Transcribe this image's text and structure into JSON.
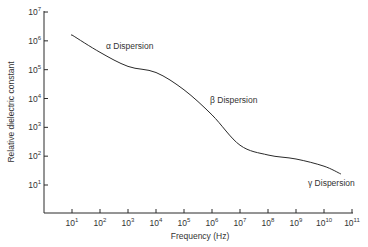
{
  "chart_data": {
    "type": "line",
    "title": "",
    "xlabel": "Frequency (Hz)",
    "ylabel": "Relative dielectric constant",
    "xscale": "log",
    "yscale": "log",
    "xlim_exp": [
      0,
      11
    ],
    "ylim_exp": [
      0,
      7
    ],
    "x_ticks": [
      "10^1",
      "10^2",
      "10^3",
      "10^4",
      "10^5",
      "10^6",
      "10^7",
      "10^8",
      "10^9",
      "10^10",
      "10^11"
    ],
    "x_tick_exp": [
      1,
      2,
      3,
      4,
      5,
      6,
      7,
      8,
      9,
      10,
      11
    ],
    "y_ticks": [
      "10^1",
      "10^2",
      "10^3",
      "10^4",
      "10^5",
      "10^6",
      "10^7"
    ],
    "y_tick_exp": [
      1,
      2,
      3,
      4,
      5,
      6,
      7
    ],
    "grid": false,
    "legend": null,
    "series": [
      {
        "name": "Relative dielectric constant",
        "x": [
          10,
          100,
          1000,
          10000,
          100000,
          1000000,
          10000000,
          100000000,
          1000000000,
          10000000000,
          40000000000
        ],
        "values": [
          1600000,
          400000,
          130000,
          80000,
          20000,
          2700,
          240,
          110,
          80,
          45,
          24
        ]
      }
    ],
    "annotations": [
      {
        "text": "α Dispersion",
        "x_exp": 2.2,
        "y_exp": 5.7
      },
      {
        "text": "β Dispersion",
        "x_exp": 5.9,
        "y_exp": 3.9
      },
      {
        "text": "γ Dispersion",
        "x_exp": 9.5,
        "y_exp": 1.1
      }
    ]
  },
  "axes": {
    "x_title": "Frequency (Hz)",
    "y_title": "Relative dielectric constant",
    "x_tick_labels": [
      {
        "base": "10",
        "exp": "1"
      },
      {
        "base": "10",
        "exp": "2"
      },
      {
        "base": "10",
        "exp": "3"
      },
      {
        "base": "10",
        "exp": "4"
      },
      {
        "base": "10",
        "exp": "5"
      },
      {
        "base": "10",
        "exp": "6"
      },
      {
        "base": "10",
        "exp": "7"
      },
      {
        "base": "10",
        "exp": "8"
      },
      {
        "base": "10",
        "exp": "9"
      },
      {
        "base": "10",
        "exp": "10"
      },
      {
        "base": "10",
        "exp": "11"
      }
    ],
    "y_tick_labels": [
      {
        "base": "10",
        "exp": "1"
      },
      {
        "base": "10",
        "exp": "2"
      },
      {
        "base": "10",
        "exp": "3"
      },
      {
        "base": "10",
        "exp": "4"
      },
      {
        "base": "10",
        "exp": "5"
      },
      {
        "base": "10",
        "exp": "6"
      },
      {
        "base": "10",
        "exp": "7"
      }
    ]
  },
  "annotations": {
    "alpha": "α Dispersion",
    "beta": "β Dispersion",
    "gamma": "γ Dispersion"
  },
  "style": {
    "line_color": "#2a2a2a",
    "axis_color": "#2a2a2a",
    "background": "#ffffff"
  }
}
